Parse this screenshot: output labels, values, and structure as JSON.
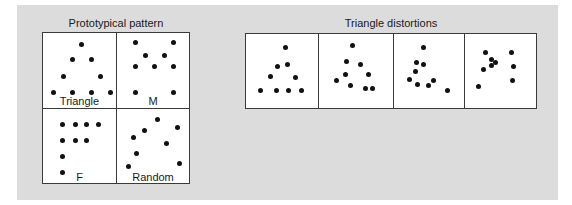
{
  "left_group": {
    "title": "Prototypical pattern",
    "cells": [
      {
        "label": "Triangle",
        "dots": [
          [
            38,
            11
          ],
          [
            29,
            26
          ],
          [
            48,
            26
          ],
          [
            20,
            43
          ],
          [
            57,
            43
          ],
          [
            10,
            59
          ],
          [
            29,
            59
          ],
          [
            48,
            59
          ],
          [
            67,
            59
          ]
        ]
      },
      {
        "label": "M",
        "dots": [
          [
            18,
            9
          ],
          [
            56,
            9
          ],
          [
            28,
            22
          ],
          [
            47,
            22
          ],
          [
            18,
            33
          ],
          [
            37,
            33
          ],
          [
            56,
            33
          ],
          [
            18,
            59
          ],
          [
            56,
            59
          ]
        ]
      },
      {
        "label": "F",
        "dots": [
          [
            19,
            15
          ],
          [
            32,
            15
          ],
          [
            43,
            15
          ],
          [
            55,
            15
          ],
          [
            19,
            31
          ],
          [
            32,
            31
          ],
          [
            43,
            31
          ],
          [
            19,
            47
          ],
          [
            19,
            63
          ]
        ]
      },
      {
        "label": "Random",
        "dots": [
          [
            40,
            10
          ],
          [
            60,
            18
          ],
          [
            27,
            21
          ],
          [
            16,
            28
          ],
          [
            49,
            34
          ],
          [
            19,
            44
          ],
          [
            62,
            54
          ],
          [
            11,
            57
          ]
        ]
      }
    ]
  },
  "right_group": {
    "title": "Triangle distortions",
    "cells": [
      {
        "dots": [
          [
            39,
            13
          ],
          [
            31,
            32
          ],
          [
            41,
            30
          ],
          [
            24,
            42
          ],
          [
            49,
            43
          ],
          [
            14,
            56
          ],
          [
            30,
            56
          ],
          [
            42,
            56
          ],
          [
            55,
            56
          ]
        ]
      },
      {
        "dots": [
          [
            33,
            11
          ],
          [
            27,
            27
          ],
          [
            41,
            30
          ],
          [
            26,
            40
          ],
          [
            49,
            40
          ],
          [
            17,
            46
          ],
          [
            31,
            51
          ],
          [
            46,
            54
          ],
          [
            53,
            54
          ]
        ]
      },
      {
        "dots": [
          [
            29,
            13
          ],
          [
            22,
            28
          ],
          [
            29,
            30
          ],
          [
            21,
            37
          ],
          [
            15,
            45
          ],
          [
            23,
            50
          ],
          [
            34,
            51
          ],
          [
            39,
            46
          ],
          [
            53,
            56
          ]
        ]
      },
      {
        "dots": [
          [
            20,
            18
          ],
          [
            26,
            25
          ],
          [
            30,
            28
          ],
          [
            26,
            31
          ],
          [
            18,
            35
          ],
          [
            46,
            18
          ],
          [
            48,
            32
          ],
          [
            47,
            46
          ],
          [
            13,
            52
          ]
        ]
      }
    ]
  }
}
